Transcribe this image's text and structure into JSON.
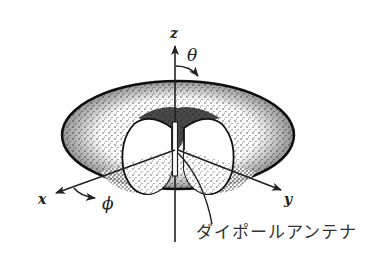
{
  "diagram": {
    "axes": {
      "z": "z",
      "x": "x",
      "y": "y"
    },
    "angles": {
      "theta": "θ",
      "phi": "ϕ"
    },
    "annotation": "ダイポールアンテナ",
    "colors": {
      "ink": "#222222",
      "background": "#ffffff"
    }
  }
}
